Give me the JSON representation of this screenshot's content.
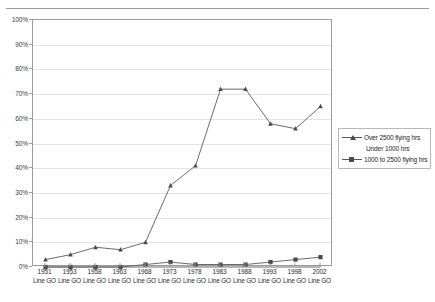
{
  "title": {
    "text": "Proportion of pilots by flying hours experience (%) by year"
  },
  "legend": {
    "position": "right",
    "entries": [
      {
        "label": "Over 2500 flying hrs",
        "marker": "triangle-marker-icon",
        "line": true
      },
      {
        "label": "Under 1000 hrs",
        "marker": "none",
        "line": false
      },
      {
        "label": "1000 to 2500 flying hrs",
        "marker": "square-marker-icon",
        "line": true
      }
    ]
  },
  "yaxis": {
    "ticks": [
      "0%",
      "10%",
      "20%",
      "30%",
      "40%",
      "50%",
      "60%",
      "70%",
      "80%",
      "90%",
      "100%"
    ]
  },
  "xaxis": {
    "sublabel": "Line GO",
    "ticks": [
      "1951",
      "1953",
      "1958",
      "1963",
      "1968",
      "1973",
      "1978",
      "1983",
      "1988",
      "1993",
      "1998",
      "2002"
    ]
  },
  "colors": {
    "series_line": "#5a5a5a",
    "marker": "#4a4a4a",
    "grid": "#e3e3e3",
    "frame": "#9b9b9b",
    "text": "#2b2b2b"
  },
  "chart_data": {
    "type": "line",
    "title": "Proportion of pilots by flying hours experience (%) by year",
    "xlabel": "",
    "ylabel": "",
    "ylim": [
      0,
      100
    ],
    "ytick_step": 10,
    "grid": true,
    "legend_position": "right",
    "categories": [
      "1951",
      "1953",
      "1958",
      "1963",
      "1968",
      "1973",
      "1978",
      "1983",
      "1988",
      "1993",
      "1998",
      "2002"
    ],
    "category_sublabels": [
      "Line GO",
      "Line GO",
      "Line GO",
      "Line GO",
      "Line GO",
      "Line GO",
      "Line GO",
      "Line GO",
      "Line GO",
      "Line GO",
      "Line GO",
      "Line GO"
    ],
    "series": [
      {
        "name": "Over 2500 flying hrs",
        "marker": "triangle",
        "values": [
          3,
          5,
          8,
          7,
          10,
          33,
          41,
          72,
          72,
          58,
          56,
          65
        ]
      },
      {
        "name": "Under 1000 hrs",
        "marker": "none",
        "values": [
          0,
          0,
          0,
          0,
          0,
          0,
          0,
          0,
          0,
          0,
          0,
          0
        ]
      },
      {
        "name": "1000 to 2500 flying hrs",
        "marker": "square",
        "values": [
          0,
          0,
          0,
          0,
          1,
          2,
          1,
          1,
          1,
          2,
          3,
          4
        ]
      }
    ]
  }
}
